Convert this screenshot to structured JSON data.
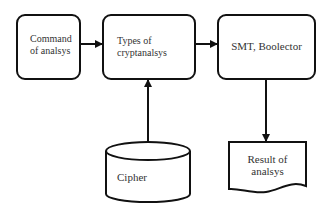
{
  "diagram": {
    "nodes": [
      {
        "id": "command",
        "shape": "rounded-rect",
        "label_lines": [
          "Command",
          "of analsys"
        ]
      },
      {
        "id": "types",
        "shape": "rounded-rect",
        "label_lines": [
          "Types of",
          "cryptanalsys"
        ]
      },
      {
        "id": "smt",
        "shape": "rounded-rect",
        "label": "SMT, Boolector"
      },
      {
        "id": "cipher",
        "shape": "cylinder",
        "label": "Cipher"
      },
      {
        "id": "result",
        "shape": "document",
        "label_lines": [
          "Result of",
          "analsys"
        ]
      }
    ],
    "edges": [
      {
        "from": "command",
        "to": "types"
      },
      {
        "from": "types",
        "to": "smt"
      },
      {
        "from": "cipher",
        "to": "types"
      },
      {
        "from": "smt",
        "to": "result"
      }
    ],
    "colors": {
      "stroke": "#111111",
      "fill": "#ffffff",
      "text": "#333333"
    }
  }
}
